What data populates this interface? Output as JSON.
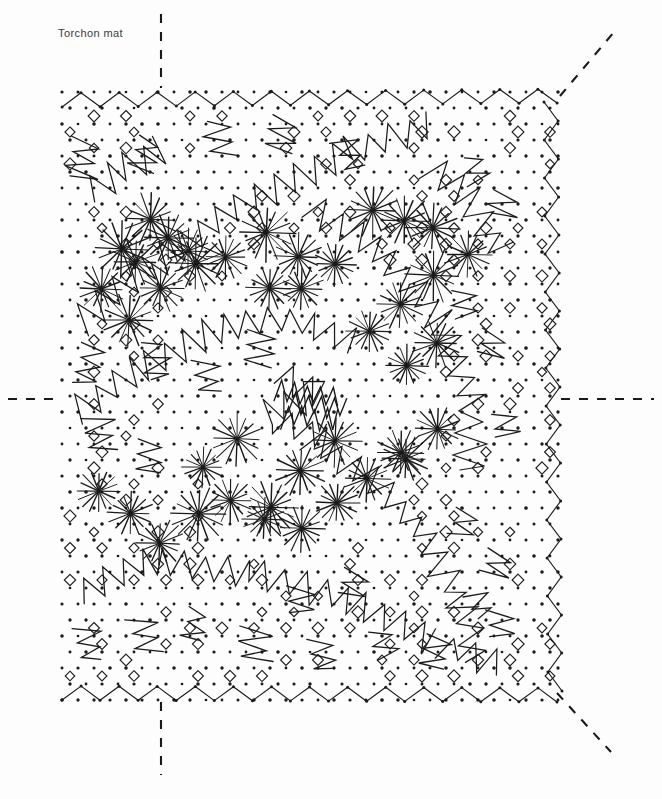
{
  "document": {
    "title": "Torchon mat",
    "kind": "bobbin-lace-pricking-diagram",
    "background_color": "#fdfdfd",
    "ink_color": "#1a1a1a"
  },
  "pattern": {
    "name": "Torchon mat",
    "bounds": {
      "left": 62,
      "top": 92,
      "right": 557,
      "bottom": 697
    },
    "dot_grid": {
      "spacing": 16,
      "lattice": "diagonal-offset",
      "dot_radius": 1.5,
      "color": "#1a1a1a"
    },
    "borders": [
      {
        "name": "top-zigzag-border",
        "edge": "top",
        "period": 19,
        "amplitude": 7
      },
      {
        "name": "bottom-zigzag-border",
        "edge": "bottom",
        "period": 19,
        "amplitude": 7
      },
      {
        "name": "right-zigzag-border",
        "edge": "right",
        "period": 19,
        "amplitude": 7
      }
    ],
    "motifs": [
      {
        "name": "spider-starburst",
        "spokes": 16,
        "radius": 22
      },
      {
        "name": "open-diamond-ring",
        "size": 7
      },
      {
        "name": "cloth-stitch-zigzag-band"
      }
    ]
  },
  "guides": {
    "color": "#1a1a1a",
    "dash": "9 9",
    "lines": [
      {
        "name": "guide-top-vertical",
        "x1": 161,
        "y1": 14,
        "x2": 161,
        "y2": 88
      },
      {
        "name": "guide-bottom-vertical",
        "x1": 161,
        "y1": 702,
        "x2": 161,
        "y2": 775
      },
      {
        "name": "guide-left-horizontal",
        "x1": 8,
        "y1": 399,
        "x2": 62,
        "y2": 399
      },
      {
        "name": "guide-right-horizontal",
        "x1": 561,
        "y1": 399,
        "x2": 654,
        "y2": 399
      },
      {
        "name": "guide-topright-diagonal",
        "x1": 560,
        "y1": 96,
        "x2": 614,
        "y2": 32
      },
      {
        "name": "guide-bottomright-diagonal",
        "x1": 557,
        "y1": 693,
        "x2": 611,
        "y2": 752
      }
    ]
  }
}
